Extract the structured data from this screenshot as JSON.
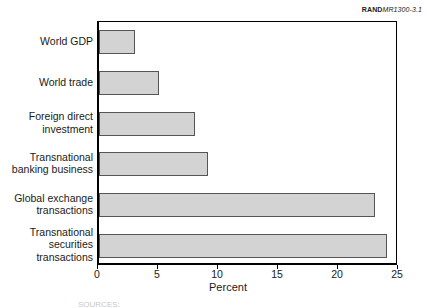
{
  "credit": {
    "brand": "RAND",
    "document_id": "MR1300-3.1"
  },
  "source_note": "SOURCES:",
  "chart_data": {
    "type": "bar",
    "orientation": "horizontal",
    "title": "",
    "subtitle": "",
    "xlabel": "Percent",
    "ylabel": "",
    "categories": [
      "World GDP",
      "World trade",
      "Foreign direct\ninvestment",
      "Transnational\nbanking business",
      "Global exchange\ntransactions",
      "Transnational\nsecurities\ntransactions"
    ],
    "values": [
      3,
      5,
      8,
      9.1,
      23,
      24
    ],
    "xticks": [
      0,
      5,
      10,
      15,
      20,
      25
    ],
    "xlim": [
      0,
      25
    ],
    "grid": false,
    "legend": null,
    "bar_fill_color": "#d3d3d3",
    "bar_border_color": "#555555",
    "axis_color": "#000000"
  }
}
